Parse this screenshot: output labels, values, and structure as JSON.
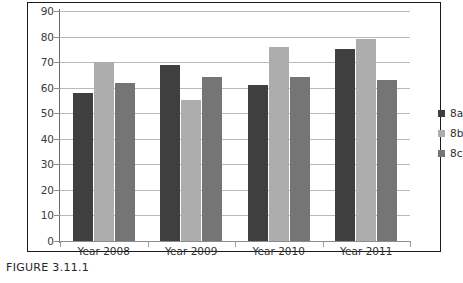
{
  "figure": {
    "caption": "FIGURE 3.11.1"
  },
  "legend": {
    "position": "right",
    "entries": [
      {
        "label": "8a",
        "color": "#3f3f3f"
      },
      {
        "label": "8b",
        "color": "#adadad"
      },
      {
        "label": "8c",
        "color": "#757575"
      }
    ]
  },
  "axis": {
    "y_ticks": [
      "90",
      "80",
      "70",
      "60",
      "50",
      "40",
      "30",
      "20",
      "10",
      "0"
    ],
    "x_labels": [
      "Year 2008",
      "Year 2009",
      "Year 2010",
      "Year 2011"
    ]
  },
  "chart_data": {
    "type": "bar",
    "title": "",
    "subtitle": "",
    "xlabel": "",
    "ylabel": "",
    "ylim": [
      0,
      90
    ],
    "ytick_step": 10,
    "grid": true,
    "legend_position": "right",
    "categories": [
      "Year 2008",
      "Year 2009",
      "Year 2010",
      "Year 2011"
    ],
    "series": [
      {
        "name": "8a",
        "color": "#3f3f3f",
        "values": [
          58,
          69,
          61,
          75
        ]
      },
      {
        "name": "8b",
        "color": "#adadad",
        "values": [
          70,
          55,
          76,
          79
        ]
      },
      {
        "name": "8c",
        "color": "#757575",
        "values": [
          62,
          64,
          64,
          63
        ]
      }
    ]
  }
}
